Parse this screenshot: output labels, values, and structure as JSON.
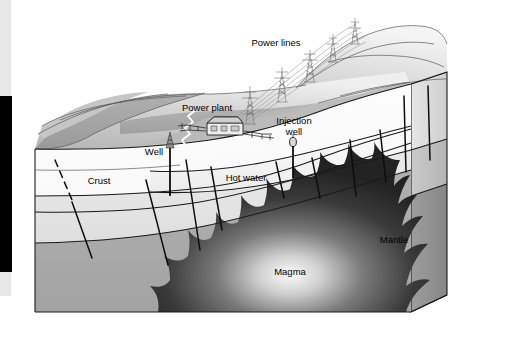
{
  "figure": {
    "kind": "geothermal-power-block-diagram"
  },
  "labels": {
    "power_lines": "Power lines",
    "power_plant": "Power plant",
    "well": "Well",
    "injection_well_line1": "Injection",
    "injection_well_line2": "well",
    "crust": "Crust",
    "hot_water": "Hot water",
    "mantle": "Mantle",
    "magma": "Magma"
  },
  "colors": {
    "background": "#ffffff",
    "terrain_light": "#d8d8d8",
    "terrain_shadow": "#a6a6a6",
    "crust_white": "#fbfbfb",
    "crust_band": "#e3e3e3",
    "aquifer": "#f2f2f2",
    "mantle": "#a8a8a8",
    "mantle_side": "#8f8f8f",
    "magma_dark": "#2a2a2a",
    "magma_glow": "#f5f5f5",
    "outline": "#1a1a1a",
    "left_artifact_bar": "#000000"
  },
  "artifacts": {
    "left_black_bar": "black vertical bar at left edge",
    "left_gray_strip": "light gray strip at far left"
  }
}
